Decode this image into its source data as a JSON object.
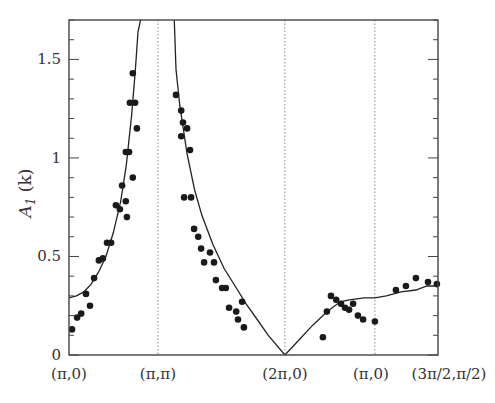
{
  "chart_data": {
    "type": "scatter",
    "title": "",
    "xlabel": "",
    "ylabel": "A_1 (k)",
    "ylabel_display": {
      "main": "A",
      "sub": "1",
      "rest": " (k)"
    },
    "ylim": [
      0,
      1.7
    ],
    "xlim": [
      0,
      1
    ],
    "grid": false,
    "legend": null,
    "x_ticks": [
      {
        "pos": 0.0,
        "label": "(π,0)"
      },
      {
        "pos": 0.241,
        "label": "(π,π)"
      },
      {
        "pos": 0.585,
        "label": "(2π,0)"
      },
      {
        "pos": 0.829,
        "label": "(π,0)"
      },
      {
        "pos": 1.0,
        "label": "(3π/2,π/2)"
      }
    ],
    "y_ticks": [
      {
        "value": 0,
        "label": "0"
      },
      {
        "value": 0.5,
        "label": "0.5"
      },
      {
        "value": 1,
        "label": "1"
      },
      {
        "value": 1.5,
        "label": "1.5"
      }
    ],
    "y_minor_step": 0.1,
    "vertical_dotted_lines": [
      0.241,
      0.585,
      0.829
    ],
    "series": [
      {
        "name": "data points",
        "kind": "scatter",
        "color": "#1a1a1a",
        "points": [
          [
            0.008,
            0.13
          ],
          [
            0.022,
            0.19
          ],
          [
            0.033,
            0.21
          ],
          [
            0.046,
            0.31
          ],
          [
            0.057,
            0.25
          ],
          [
            0.068,
            0.39
          ],
          [
            0.081,
            0.48
          ],
          [
            0.092,
            0.49
          ],
          [
            0.103,
            0.57
          ],
          [
            0.114,
            0.57
          ],
          [
            0.127,
            0.76
          ],
          [
            0.138,
            0.74
          ],
          [
            0.144,
            0.86
          ],
          [
            0.157,
            0.7
          ],
          [
            0.154,
            0.78
          ],
          [
            0.154,
            1.03
          ],
          [
            0.163,
            1.03
          ],
          [
            0.173,
            0.9
          ],
          [
            0.165,
            1.28
          ],
          [
            0.179,
            1.28
          ],
          [
            0.173,
            1.43
          ],
          [
            0.184,
            1.15
          ],
          [
            0.29,
            1.32
          ],
          [
            0.304,
            1.24
          ],
          [
            0.309,
            1.18
          ],
          [
            0.32,
            1.15
          ],
          [
            0.304,
            1.11
          ],
          [
            0.328,
            1.04
          ],
          [
            0.312,
            0.8
          ],
          [
            0.331,
            0.8
          ],
          [
            0.339,
            0.64
          ],
          [
            0.35,
            0.6
          ],
          [
            0.358,
            0.54
          ],
          [
            0.382,
            0.52
          ],
          [
            0.366,
            0.47
          ],
          [
            0.393,
            0.47
          ],
          [
            0.398,
            0.38
          ],
          [
            0.415,
            0.34
          ],
          [
            0.425,
            0.34
          ],
          [
            0.469,
            0.27
          ],
          [
            0.434,
            0.24
          ],
          [
            0.453,
            0.22
          ],
          [
            0.458,
            0.18
          ],
          [
            0.474,
            0.14
          ],
          [
            0.688,
            0.09
          ],
          [
            0.699,
            0.22
          ],
          [
            0.71,
            0.3
          ],
          [
            0.724,
            0.28
          ],
          [
            0.737,
            0.26
          ],
          [
            0.748,
            0.24
          ],
          [
            0.759,
            0.23
          ],
          [
            0.77,
            0.26
          ],
          [
            0.783,
            0.2
          ],
          [
            0.797,
            0.18
          ],
          [
            0.829,
            0.17
          ],
          [
            0.886,
            0.33
          ],
          [
            0.913,
            0.35
          ],
          [
            0.94,
            0.39
          ],
          [
            0.973,
            0.37
          ],
          [
            0.997,
            0.36
          ]
        ]
      },
      {
        "name": "theory curve",
        "kind": "line",
        "color": "#222222",
        "points": [
          [
            0.0,
            0.29
          ],
          [
            0.02,
            0.3
          ],
          [
            0.04,
            0.32
          ],
          [
            0.06,
            0.36
          ],
          [
            0.08,
            0.42
          ],
          [
            0.1,
            0.5
          ],
          [
            0.12,
            0.62
          ],
          [
            0.14,
            0.78
          ],
          [
            0.155,
            0.96
          ],
          [
            0.17,
            1.22
          ],
          [
            0.18,
            1.45
          ],
          [
            0.187,
            1.64
          ],
          [
            0.195,
            1.71
          ]
        ],
        "points_right_branch": [
          [
            0.285,
            1.71
          ],
          [
            0.29,
            1.45
          ],
          [
            0.3,
            1.27
          ],
          [
            0.32,
            1.02
          ],
          [
            0.34,
            0.84
          ],
          [
            0.36,
            0.71
          ],
          [
            0.39,
            0.56
          ],
          [
            0.42,
            0.44
          ],
          [
            0.45,
            0.35
          ],
          [
            0.48,
            0.26
          ],
          [
            0.51,
            0.18
          ],
          [
            0.54,
            0.1
          ],
          [
            0.585,
            0.0
          ]
        ],
        "points_after_min": [
          [
            0.585,
            0.0
          ],
          [
            0.62,
            0.07
          ],
          [
            0.66,
            0.15
          ],
          [
            0.7,
            0.22
          ],
          [
            0.735,
            0.27
          ],
          [
            0.76,
            0.28
          ],
          [
            0.8,
            0.29
          ],
          [
            0.829,
            0.29
          ],
          [
            0.86,
            0.3
          ],
          [
            0.9,
            0.32
          ],
          [
            0.94,
            0.33
          ],
          [
            0.97,
            0.35
          ],
          [
            1.0,
            0.35
          ]
        ]
      }
    ]
  }
}
